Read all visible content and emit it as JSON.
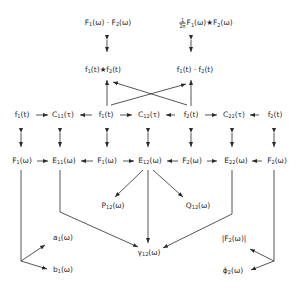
{
  "diagram": {
    "top_row": {
      "product_of_transforms": {
        "a": "F",
        "a_sub": "1",
        "a_arg": "(ω)",
        "op": " · ",
        "b": "F",
        "b_sub": "2",
        "b_arg": "(ω)"
      },
      "convolution_of_transforms": {
        "frac_num": "1",
        "frac_den": "2π",
        "a": "F",
        "a_sub": "1",
        "a_arg": "(ω)",
        "op": "★",
        "b": "F",
        "b_sub": "2",
        "b_arg": "(ω)"
      }
    },
    "time_products": {
      "convolution": {
        "a": "f",
        "a_sub": "1",
        "a_arg": "(t)",
        "op": "★",
        "b": "f",
        "b_sub": "2",
        "b_arg": "(t)"
      },
      "product": {
        "a": "f",
        "a_sub": "1",
        "a_arg": "(t)",
        "op": " · ",
        "b": "f",
        "b_sub": "2",
        "b_arg": "(t)"
      }
    },
    "time_row": [
      {
        "sym": "f",
        "sub": "1",
        "arg": "(t)"
      },
      {
        "sym": "C",
        "sub": "11",
        "arg": "(τ)"
      },
      {
        "sym": "f",
        "sub": "1",
        "arg": "(t)"
      },
      {
        "sym": "C",
        "sub": "12",
        "arg": "(τ)"
      },
      {
        "sym": "f",
        "sub": "2",
        "arg": "(t)"
      },
      {
        "sym": "C",
        "sub": "22",
        "arg": "(τ)"
      },
      {
        "sym": "f",
        "sub": "2",
        "arg": "(t)"
      }
    ],
    "freq_row": [
      {
        "sym": "F",
        "sub": "1",
        "arg": "(ω)"
      },
      {
        "sym": "E",
        "sub": "11",
        "arg": "(ω)"
      },
      {
        "sym": "F",
        "sub": "1",
        "arg": "(ω)"
      },
      {
        "sym": "E",
        "sub": "12",
        "arg": "(ω)"
      },
      {
        "sym": "F",
        "sub": "2",
        "arg": "(ω)"
      },
      {
        "sym": "E",
        "sub": "22",
        "arg": "(ω)"
      },
      {
        "sym": "F",
        "sub": "2",
        "arg": "(ω)"
      }
    ],
    "derived": {
      "P12": {
        "sym": "P",
        "sub": "12",
        "arg": "(ω)"
      },
      "Q12": {
        "sym": "Q",
        "sub": "12",
        "arg": "(ω)"
      },
      "gamma12": {
        "sym": "γ",
        "sub": "12",
        "arg": "(ω)"
      },
      "a1": {
        "sym": "a",
        "sub": "1",
        "arg": "(ω)"
      },
      "b1": {
        "sym": "b",
        "sub": "1",
        "arg": "(ω)"
      },
      "absF2": {
        "pre": "|F",
        "sub": "2",
        "arg": "(ω)|"
      },
      "phi2": {
        "sym": "ϕ",
        "sub": "2",
        "arg": "(ω)"
      }
    },
    "colors": {
      "ink": "#2a2a2a",
      "background": "#ffffff"
    }
  }
}
